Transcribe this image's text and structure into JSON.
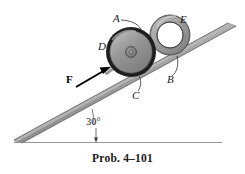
{
  "figure": {
    "caption": "Prob. 4–101",
    "background_color": "#ffffff",
    "labels": {
      "a": "A",
      "b": "B",
      "c": "C",
      "d": "D",
      "e": "E",
      "force": "F",
      "angle": "30°"
    },
    "colors": {
      "incline_face": "#9a9a9a",
      "incline_edge": "#6f6f6f",
      "incline_top_shade": "#b4b4b4",
      "wheel_rim": "#1c1c1c",
      "wheel_body": "#8d8d8d",
      "wheel_highlight": "#b9b9b9",
      "hub": "#7a7a7a",
      "ring_body": "#9d9d9d",
      "ring_outline": "#4a4a4a",
      "rod": "#b0b0b0",
      "arrow": "#000000",
      "ground_line": "#8b8b8b",
      "leader_line": "#3a3a3a",
      "text": "#1a1a1a"
    },
    "geometry": {
      "incline_angle_degrees": 30,
      "wheel_center": [
        131,
        52
      ],
      "wheel_outer_radius": 25,
      "ring_center": [
        170,
        35
      ],
      "ring_outer_radius": 20,
      "ring_inner_radius": 13,
      "force_arrow_tail": [
        76,
        86
      ],
      "force_arrow_head": [
        110,
        66
      ]
    },
    "parts": {
      "wheel": "wheel-d",
      "ring": "ring-e",
      "incline": "inclined-plane",
      "rod": "force-rod",
      "ground": "horizontal-reference-line"
    }
  }
}
